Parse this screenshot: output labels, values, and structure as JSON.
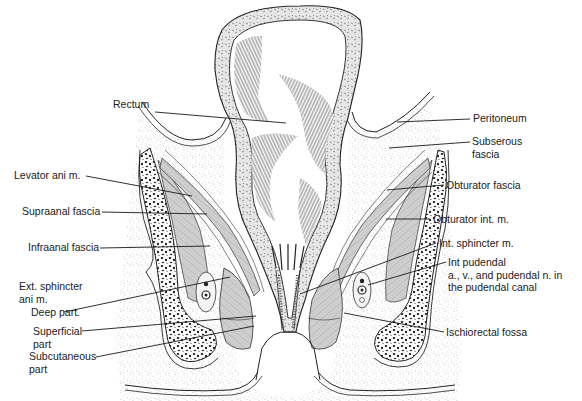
{
  "diagram": {
    "labels_left": [
      {
        "id": "rectum",
        "text": "Rectum",
        "x": 113,
        "y": 104
      },
      {
        "id": "levator-ani",
        "text": "Levator ani m.",
        "x": 14,
        "y": 172
      },
      {
        "id": "supraanal-fascia",
        "text": "Supraanal fascia",
        "x": 22,
        "y": 207
      },
      {
        "id": "infraanal-fascia",
        "text": "Infraanal fascia",
        "x": 28,
        "y": 243
      },
      {
        "id": "ext-sphincter",
        "text": "Ext. sphincter\nani m.",
        "x": 19,
        "y": 279
      },
      {
        "id": "deep-part",
        "text": "Deep part.",
        "x": 31,
        "y": 307
      },
      {
        "id": "superficial-part",
        "text": "Superficial\npart",
        "x": 33,
        "y": 327
      },
      {
        "id": "subcutaneous-part",
        "text": "Subcutaneous\npart",
        "x": 29,
        "y": 351
      }
    ],
    "labels_right": [
      {
        "id": "peritoneum",
        "text": "Peritoneum",
        "x": 473,
        "y": 114
      },
      {
        "id": "subserous-fascia",
        "text": "Subserous\nfascia",
        "x": 472,
        "y": 136
      },
      {
        "id": "obturator-fascia",
        "text": "Obturator fascia",
        "x": 446,
        "y": 180
      },
      {
        "id": "obturator-int",
        "text": "Obturator int. m.",
        "x": 433,
        "y": 214
      },
      {
        "id": "int-sphincter",
        "text": "Int. sphincter m.",
        "x": 439,
        "y": 238
      },
      {
        "id": "int-pudendal",
        "text": "Int pudendal\na., v., and pudendal n. in\nthe pudendal canal",
        "x": 448,
        "y": 257
      },
      {
        "id": "ischiorectal-fossa",
        "text": "Ischiorectal fossa",
        "x": 446,
        "y": 327
      }
    ],
    "colors": {
      "ink": "#1a1a1a",
      "background": "#ffffff",
      "fat_stipple": "#9a9a9a",
      "muscle_gray": "#c4c4c4",
      "bone_dots": "#222222"
    }
  }
}
